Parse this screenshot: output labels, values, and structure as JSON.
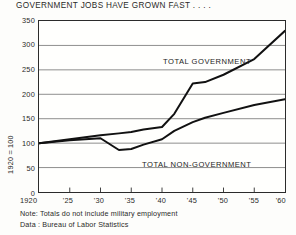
{
  "chart_data": {
    "type": "line",
    "title": "GOVERNMENT JOBS HAVE GROWN FAST . . . .",
    "xlabel": "",
    "ylabel": "1920 = 100",
    "xlim": [
      1920,
      1960
    ],
    "ylim": [
      0,
      350
    ],
    "grid": true,
    "legend_position": "inline-annotations",
    "x_tick_labels": [
      "1920",
      "'25",
      "'30",
      "'35",
      "'40",
      "'45",
      "'50",
      "'55",
      "'60"
    ],
    "x_tick_values": [
      1920,
      1925,
      1930,
      1935,
      1940,
      1945,
      1950,
      1955,
      1960
    ],
    "y_tick_labels": [
      "0",
      "50",
      "100",
      "150",
      "200",
      "250",
      "300",
      "350"
    ],
    "y_tick_values": [
      0,
      50,
      100,
      150,
      200,
      250,
      300,
      350
    ],
    "series": [
      {
        "name": "TOTAL GOVERNMENT",
        "color": "#111111",
        "x": [
          1920,
          1925,
          1930,
          1933,
          1935,
          1937,
          1940,
          1942,
          1945,
          1947,
          1950,
          1955,
          1960
        ],
        "values": [
          100,
          108,
          116,
          120,
          123,
          128,
          133,
          160,
          222,
          225,
          240,
          272,
          330
        ]
      },
      {
        "name": "TOTAL NON-GOVERNMENT",
        "color": "#111111",
        "x": [
          1920,
          1925,
          1930,
          1933,
          1935,
          1937,
          1940,
          1942,
          1945,
          1947,
          1950,
          1955,
          1960
        ],
        "values": [
          100,
          106,
          110,
          86,
          88,
          97,
          108,
          125,
          143,
          152,
          162,
          178,
          190
        ]
      }
    ],
    "annotations": [
      {
        "text": "TOTAL GOVERNMENT",
        "x": 1946,
        "y": 268
      },
      {
        "text": "TOTAL NON-GOVERNMENT",
        "x": 1942,
        "y": 92
      }
    ]
  },
  "footnotes": {
    "note_label": "Note:",
    "note_text": "Totals do not include military employment",
    "data_label": "Data :",
    "data_text": "Bureau of Labor Statistics",
    "note_line": "Note:  Totals do not include military employment",
    "data_line": "Data :  Bureau of Labor Statistics"
  }
}
